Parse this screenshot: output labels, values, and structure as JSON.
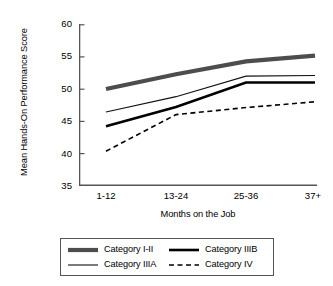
{
  "chart_data": {
    "type": "line",
    "title": "",
    "xlabel": "Months on the Job",
    "ylabel": "Mean Hands-On Performance Score",
    "categories": [
      "1-12",
      "13-24",
      "25-36",
      "37+"
    ],
    "ylim": [
      35,
      60
    ],
    "yticks": [
      35,
      40,
      45,
      50,
      55,
      60
    ],
    "grid": false,
    "legend_position": "below-plot",
    "series": [
      {
        "name": "Category I-II",
        "values": [
          50.0,
          52.3,
          54.3,
          55.2
        ],
        "color": "#4d4d4d",
        "style": "solid",
        "width": 4.2
      },
      {
        "name": "Category IIIA",
        "values": [
          46.4,
          48.8,
          52.0,
          52.1
        ],
        "color": "#111111",
        "style": "solid",
        "width": 1.1
      },
      {
        "name": "Category IIIB",
        "values": [
          44.2,
          47.2,
          51.0,
          51.0
        ],
        "color": "#000000",
        "style": "solid",
        "width": 2.6
      },
      {
        "name": "Category IV",
        "values": [
          40.3,
          46.0,
          47.1,
          48.0
        ],
        "color": "#000000",
        "style": "dashed",
        "width": 1.6
      }
    ]
  },
  "axes": {
    "ytick_labels": [
      "60",
      "55",
      "50",
      "45",
      "40",
      "35"
    ],
    "xtick_labels": [
      "1-12",
      "13-24",
      "25-36",
      "37+"
    ],
    "ylabel": "Mean Hands-On Performance Score",
    "xlabel": "Months on the Job"
  },
  "legend": {
    "items": [
      {
        "label": "Category I-II",
        "swatch": "thick-gray-line"
      },
      {
        "label": "Category IIIB",
        "swatch": "thick-black-line"
      },
      {
        "label": "Category IIIA",
        "swatch": "thin-black-line"
      },
      {
        "label": "Category IV",
        "swatch": "dashed-black-line"
      }
    ]
  },
  "colors": {
    "axis": "#555555",
    "series_i_ii": "#4d4d4d",
    "series_iiia": "#111111",
    "series_iiib": "#000000",
    "series_iv": "#000000",
    "background": "#ffffff"
  }
}
